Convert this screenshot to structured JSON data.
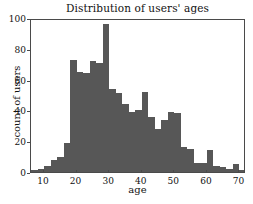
{
  "chart_data": {
    "type": "bar",
    "title": "Distribution of users' ages",
    "xlabel": "age",
    "ylabel": "count of users",
    "xlim": [
      6,
      72
    ],
    "ylim": [
      0,
      100
    ],
    "grid": false,
    "legend": null,
    "bin_width": 2,
    "bar_color": "#575757",
    "xticks": [
      10,
      20,
      30,
      40,
      50,
      60,
      70
    ],
    "yticks": [
      0,
      20,
      40,
      60,
      80,
      100
    ],
    "categories": [
      6,
      8,
      10,
      12,
      14,
      16,
      18,
      20,
      22,
      24,
      26,
      28,
      30,
      32,
      34,
      36,
      38,
      40,
      42,
      44,
      46,
      48,
      50,
      52,
      54,
      56,
      58,
      60,
      62,
      64,
      66,
      68,
      70
    ],
    "values": [
      1,
      2,
      4,
      8,
      10,
      19,
      73,
      65,
      64,
      72,
      71,
      96,
      54,
      51,
      44,
      39,
      40,
      52,
      36,
      28,
      34,
      39,
      38,
      16,
      15,
      6,
      6,
      14,
      4,
      3,
      2,
      5,
      1
    ]
  },
  "axes": {
    "y_tick_labels": [
      "100",
      "80",
      "60",
      "40",
      "20",
      "0"
    ],
    "x_tick_labels": [
      "10",
      "20",
      "30",
      "40",
      "50",
      "60",
      "70"
    ]
  }
}
